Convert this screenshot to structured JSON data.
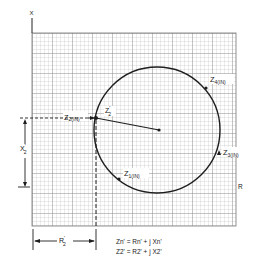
{
  "figure": {
    "axes": {
      "vertical_label": "X",
      "horizontal_label": "R"
    },
    "points": [
      {
        "id": "z1",
        "label": "Z",
        "sub": "1(IN)"
      },
      {
        "id": "z2",
        "label": "Z",
        "sub": "2(IN)"
      },
      {
        "id": "z3",
        "label": "Z",
        "sub": "3(IN)"
      },
      {
        "id": "z4",
        "label": "Z",
        "sub": "4(IN)"
      }
    ],
    "radius_label": {
      "main": "Z",
      "sub": "2",
      "sup": "'"
    },
    "dimensions": {
      "x2": {
        "main": "X",
        "sub": "2",
        "sup": "'"
      },
      "r2": {
        "main": "R",
        "sub": "2",
        "sup": "'"
      }
    },
    "equations": [
      {
        "lhs": "Zn' = Rn' + j Xn'"
      },
      {
        "lhs": "Z2' = R2' + j X2'"
      }
    ],
    "colors": {
      "grid_fine": "#b8b8b8",
      "grid_major": "#8a8a8a",
      "ink": "#1e1e1e"
    }
  }
}
